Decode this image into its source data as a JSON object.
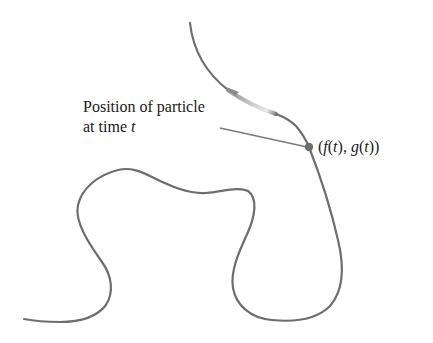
{
  "diagram": {
    "annotation": {
      "line1": "Position of particle",
      "line2_prefix": "at time ",
      "line2_var": "t"
    },
    "point_label": {
      "open": "(",
      "f": "f",
      "f_arg": "(t)",
      "sep": ", ",
      "g": "g",
      "g_arg": "(t)",
      "close": ")"
    },
    "colors": {
      "curve": "#6e6e6e",
      "point": "#6e6e6e",
      "leader_line": "#7a7a7a",
      "arrow_fade": "#d8d8d8",
      "text": "#1a1a1a",
      "background": "#ffffff"
    }
  }
}
